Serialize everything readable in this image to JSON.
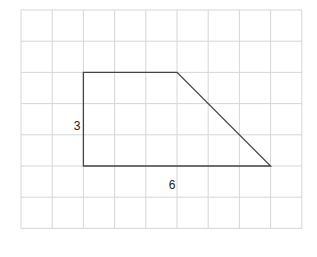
{
  "diagram": {
    "type": "trapezoid-on-grid",
    "grid": {
      "columns": 9,
      "rows": 7,
      "origin_px": [
        21,
        10
      ],
      "cell_px": 31.2,
      "line_color": "#d6d6d6"
    },
    "shape": {
      "stroke_color": "#444444",
      "vertices_grid": [
        [
          2,
          2
        ],
        [
          5,
          2
        ],
        [
          8,
          5
        ],
        [
          2,
          5
        ]
      ]
    },
    "labels": [
      {
        "id": "height",
        "text": "3",
        "x": 77,
        "y": 130
      },
      {
        "id": "base",
        "text": "6",
        "x": 172,
        "y": 189
      }
    ]
  }
}
